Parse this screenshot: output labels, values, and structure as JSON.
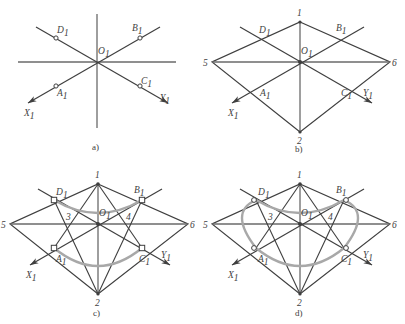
{
  "figure": {
    "colors": {
      "line": "#3f3f3f",
      "arc": "#9a9a9a",
      "axis": "#5a5a5a",
      "background": "#ffffff",
      "marker_fill": "#ffffff",
      "marker_stroke": "#3f3f3f"
    }
  },
  "panels": [
    {
      "id": "a",
      "caption": "a)",
      "description": "isometric axes with four points",
      "center_label": "O",
      "center_sub": "1",
      "axes": [
        {
          "name": "x-axis",
          "label": "X",
          "sub": "1",
          "arrow": true
        },
        {
          "name": "y-axis",
          "label": "Y",
          "sub": "1",
          "arrow": true
        }
      ],
      "points": [
        {
          "label": "A",
          "sub": "1",
          "marker": "circle"
        },
        {
          "label": "B",
          "sub": "1",
          "marker": "circle"
        },
        {
          "label": "C",
          "sub": "1",
          "marker": "circle"
        },
        {
          "label": "D",
          "sub": "1",
          "marker": "circle"
        }
      ]
    },
    {
      "id": "b",
      "caption": "b)",
      "description": "rhombus drawn through the four points",
      "center_label": "O",
      "center_sub": "1",
      "axes": [
        {
          "name": "x-axis",
          "label": "X",
          "sub": "1",
          "arrow": true
        },
        {
          "name": "y-axis",
          "label": "Y",
          "sub": "1",
          "arrow": true
        }
      ],
      "points": [
        {
          "label": "A",
          "sub": "1",
          "marker": "none"
        },
        {
          "label": "B",
          "sub": "1",
          "marker": "none"
        },
        {
          "label": "C",
          "sub": "1",
          "marker": "none"
        },
        {
          "label": "D",
          "sub": "1",
          "marker": "none"
        }
      ],
      "vertices": [
        {
          "label": "1",
          "position": "top"
        },
        {
          "label": "2",
          "position": "bottom"
        },
        {
          "label": "5",
          "position": "left"
        },
        {
          "label": "6",
          "position": "right"
        }
      ]
    },
    {
      "id": "c",
      "caption": "c)",
      "description": "two large arcs struck from vertices 1 and 2",
      "center_label": "O",
      "center_sub": "1",
      "axes": [
        {
          "name": "x-axis",
          "label": "X",
          "sub": "1",
          "arrow": true
        },
        {
          "name": "y-axis",
          "label": "Y",
          "sub": "1",
          "arrow": true
        }
      ],
      "points": [
        {
          "label": "A",
          "sub": "1",
          "marker": "square"
        },
        {
          "label": "B",
          "sub": "1",
          "marker": "square"
        },
        {
          "label": "C",
          "sub": "1",
          "marker": "square"
        },
        {
          "label": "D",
          "sub": "1",
          "marker": "square"
        }
      ],
      "vertices": [
        {
          "label": "1",
          "position": "top"
        },
        {
          "label": "2",
          "position": "bottom"
        },
        {
          "label": "5",
          "position": "left"
        },
        {
          "label": "6",
          "position": "right"
        },
        {
          "label": "3",
          "position": "left-inner"
        },
        {
          "label": "4",
          "position": "right-inner"
        }
      ]
    },
    {
      "id": "d",
      "caption": "d)",
      "description": "completed four-centre ellipse",
      "center_label": "O",
      "center_sub": "1",
      "axes": [
        {
          "name": "x-axis",
          "label": "X",
          "sub": "1",
          "arrow": true
        },
        {
          "name": "y-axis",
          "label": "Y",
          "sub": "1",
          "arrow": true
        }
      ],
      "points": [
        {
          "label": "A",
          "sub": "1",
          "marker": "ring"
        },
        {
          "label": "B",
          "sub": "1",
          "marker": "ring"
        },
        {
          "label": "C",
          "sub": "1",
          "marker": "ring"
        },
        {
          "label": "D",
          "sub": "1",
          "marker": "ring"
        }
      ],
      "vertices": [
        {
          "label": "1",
          "position": "top"
        },
        {
          "label": "2",
          "position": "bottom"
        },
        {
          "label": "5",
          "position": "left"
        },
        {
          "label": "6",
          "position": "right"
        },
        {
          "label": "3",
          "position": "left-inner"
        },
        {
          "label": "4",
          "position": "right-inner"
        }
      ]
    }
  ]
}
